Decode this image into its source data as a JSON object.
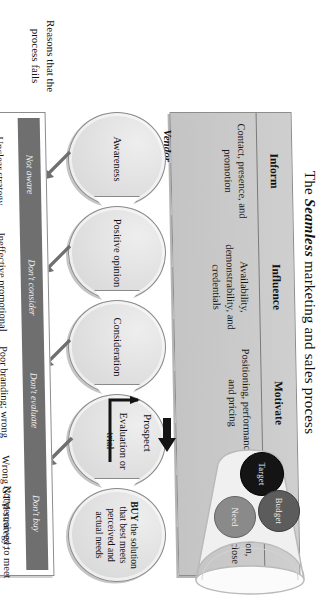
{
  "title": {
    "prefix": "The ",
    "emphasis": "Seamless",
    "suffix": " marketing and sales process"
  },
  "vendor": {
    "label": "Vendor",
    "columns": [
      {
        "head": "Inform",
        "body": "Contact, presence, and promotion"
      },
      {
        "head": "Influence",
        "body": "Availability, demonstrability, and credentials"
      },
      {
        "head": "Motivate",
        "body": "Positioning, performance, and pricing"
      },
      {
        "head": "Sell",
        "body": "Value proposition, negotiation, and close"
      }
    ]
  },
  "stages": [
    {
      "text": "Awareness"
    },
    {
      "text": "Positive opinion"
    },
    {
      "text": "Consideration"
    },
    {
      "text": "Evaluation or trial"
    },
    {
      "text": "BUY the solution that best meets perceived and actual needs",
      "emphasis": "BUY"
    }
  ],
  "buyer": {
    "label": "Buyer",
    "reasons_heading": "Reasons that the process fails",
    "strip": [
      "Not aware",
      "Don't consider",
      "Don't evaluate",
      "Don't buy"
    ],
    "reasons": [
      "Unclear strategy, positioning, and targeting",
      "Ineffective promotional methods and messages",
      "Poor branding; wrong pricing; no competitive advantage",
      "Wrong GTM strategy; wrong people; poor process control"
    ],
    "last_reason": "Not perceived to meet needs at the right price at the right time"
  },
  "funnel": {
    "circles": [
      {
        "name": "Target",
        "color": "#141414"
      },
      {
        "name": "Budget",
        "color": "#5c5c5c"
      },
      {
        "name": "Need",
        "color": "#8a8a8a"
      }
    ],
    "prospect_label": "Prospect"
  },
  "colors": {
    "vendor_band": "#c8c8c8",
    "buyer_strip": "#6f6f6f",
    "oval_fill": "#e2e2e2",
    "outline": "#8a8a8a",
    "text": "#161616"
  }
}
